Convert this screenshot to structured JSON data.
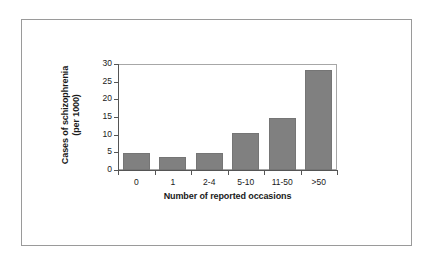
{
  "chart_data": {
    "type": "bar",
    "title": "",
    "subtitle": "",
    "xlabel": "Number of reported occasions",
    "ylabel": "Cases of schizophrenia (per 1000)",
    "ylabel_line1": "Cases of schizophrenia",
    "ylabel_line2": "(per 1000)",
    "categories": [
      "0",
      "1",
      "2-4",
      "5-10",
      "11-50",
      ">50"
    ],
    "values": [
      4.8,
      3.7,
      4.9,
      10.6,
      14.7,
      28.2
    ],
    "ylim": [
      0,
      30
    ],
    "ytick_labels": [
      "0",
      "5",
      "10",
      "15",
      "20",
      "25",
      "30"
    ],
    "ytick_values": [
      0,
      5,
      10,
      15,
      20,
      25,
      30
    ],
    "grid": false,
    "legend": "none",
    "bar_color": "#808080",
    "axis_color": "#555555",
    "frame_color": "#9a9a9a",
    "text_color": "#1a1a1a"
  }
}
